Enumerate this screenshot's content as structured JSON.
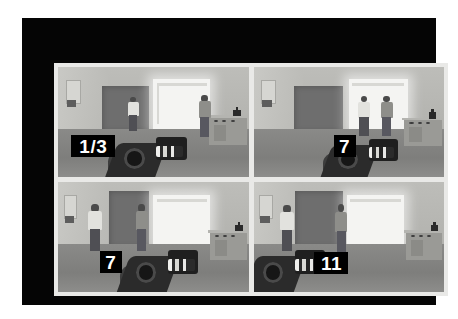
{
  "media": {
    "kind": "game-screenshot-grid",
    "layout": "2x2",
    "palette": {
      "frame": "#050505",
      "mount": "#e9e9e7",
      "page_background": "#ffffff",
      "wall": "#b8b8b4",
      "floor": "#848482",
      "bright_doorway": "#f4f4f2",
      "dark_doorway": "#6e6e6e",
      "badge_background": "#000000",
      "badge_text": "#ffffff"
    }
  },
  "panels": [
    {
      "id": "panel-top-left",
      "badge": "1/3",
      "badge_width": 44,
      "badge_height": 22,
      "badge_font_size": 19,
      "scene": {
        "description": "First-person view of a grey room: dark doorway at left-centre, bright lit doorway centre-right, two standing figures, counter with bottle at right, weapon raised at bottom centre",
        "figure_count": 2
      }
    },
    {
      "id": "panel-top-right",
      "badge": "7",
      "badge_width": 22,
      "badge_height": 22,
      "badge_font_size": 19,
      "scene": {
        "description": "Same room; two figures standing face to face in the bright doorway, counter with bottle at right, weapon at bottom centre",
        "figure_count": 2
      }
    },
    {
      "id": "panel-bottom-left",
      "badge": "7",
      "badge_width": 22,
      "badge_height": 22,
      "badge_font_size": 19,
      "scene": {
        "description": "Same room viewed further left; two figures near the left wall and dark doorway, counter with bottle at right, weapon at bottom centre",
        "figure_count": 2
      }
    },
    {
      "id": "panel-bottom-right",
      "badge": "11",
      "badge_width": 34,
      "badge_height": 22,
      "badge_font_size": 19,
      "scene": {
        "description": "Same room; one figure at the left wall and one beside the dark doorway, counter with bottle at right, weapon at bottom left",
        "figure_count": 2
      }
    }
  ]
}
